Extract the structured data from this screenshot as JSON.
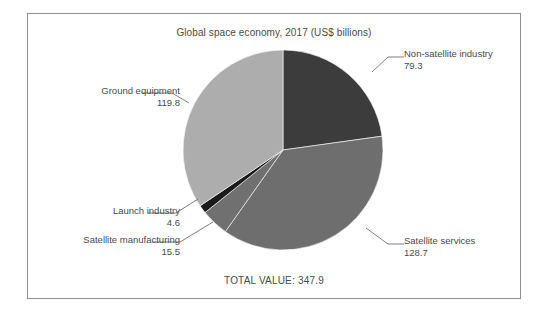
{
  "chart_data": {
    "type": "pie",
    "title": "Global space economy, 2017 (US$ billions)",
    "categories": [
      "Non-satellite industry",
      "Satellite services",
      "Satellite manufacturing",
      "Launch industry",
      "Ground equipment"
    ],
    "values": [
      79.3,
      128.7,
      15.5,
      4.6,
      119.8
    ],
    "slices": [
      {
        "label": "Non-satellite industry",
        "value": "79.3",
        "number": 79.3,
        "color": "#3c3c3c",
        "callout_side": "right"
      },
      {
        "label": "Satellite services",
        "value": "128.7",
        "number": 128.7,
        "color": "#6e6e6e",
        "callout_side": "right"
      },
      {
        "label": "Satellite manufacturing",
        "value": "15.5",
        "number": 15.5,
        "color": "#707070",
        "callout_side": "left"
      },
      {
        "label": "Launch industry",
        "value": "4.6",
        "number": 4.6,
        "color": "#1a1a1a",
        "callout_side": "left"
      },
      {
        "label": "Ground equipment",
        "value": "119.8",
        "number": 119.8,
        "color": "#adadad",
        "callout_side": "left"
      }
    ],
    "total_label": "TOTAL VALUE: 347.9",
    "total_value": 347.9,
    "units": "US$ billions",
    "year": "2017",
    "legend": "none",
    "grid": false,
    "xlabel": "",
    "ylabel": ""
  },
  "figure": {
    "title": "Global space economy, 2017 (US$ billions)",
    "total": "TOTAL VALUE: 347.9",
    "border_color": "#8e8e8e",
    "background": "#ffffff"
  },
  "callouts": {
    "nonsatellite": {
      "label": "Non-satellite industry",
      "value": "79.3"
    },
    "satellite_services": {
      "label": "Satellite services",
      "value": "128.7"
    },
    "ground_equipment": {
      "label": "Ground equipment",
      "value": "119.8"
    },
    "launch_industry": {
      "label": "Launch industry",
      "value": "4.6"
    },
    "satellite_manufacturing": {
      "label": "Satellite manufacturing",
      "value": "15.5"
    }
  }
}
